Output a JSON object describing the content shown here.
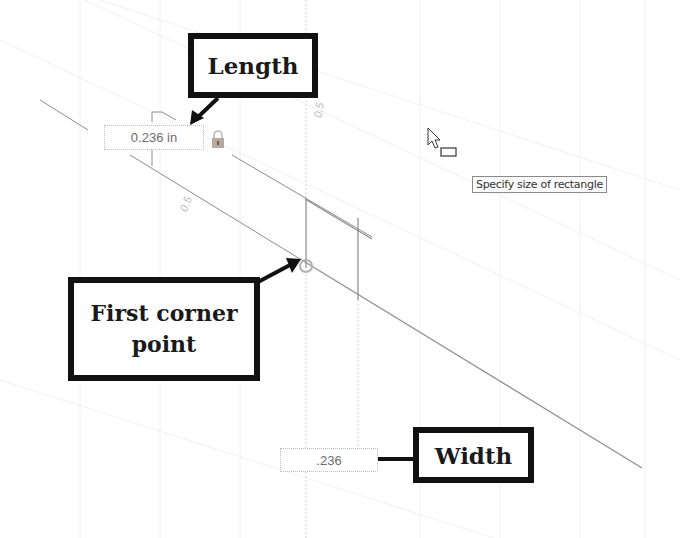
{
  "canvas": {
    "background": "#ffffff",
    "grid_color": "#ececec",
    "line_color": "#9a9a9a"
  },
  "callouts": {
    "length": {
      "label": "Length"
    },
    "first_corner": {
      "label_line1": "First corner",
      "label_line2": "point"
    },
    "width": {
      "label": "Width"
    }
  },
  "dimension_inputs": {
    "length_value": "0.236 in",
    "width_value": ".236"
  },
  "dimension_labels": {
    "top_vertical": "0.5",
    "left_diagonal": "0.5"
  },
  "tooltip": {
    "text": "Specify size of rectangle"
  },
  "icons": {
    "lock": "lock-icon",
    "cursor": "rectangle-cursor-icon",
    "corner_point": "snap-point-icon"
  },
  "colors": {
    "callout_border": "#111111",
    "lock": "#b5a9a0"
  }
}
